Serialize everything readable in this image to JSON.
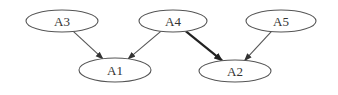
{
  "diagram": {
    "type": "directed-graph",
    "nodes": [
      {
        "id": "A3",
        "label": "A3",
        "cx": 62,
        "cy": 21,
        "rx": 36,
        "ry": 11
      },
      {
        "id": "A4",
        "label": "A4",
        "cx": 173,
        "cy": 21,
        "rx": 34,
        "ry": 11
      },
      {
        "id": "A5",
        "label": "A5",
        "cx": 281,
        "cy": 21,
        "rx": 35,
        "ry": 11
      },
      {
        "id": "A1",
        "label": "A1",
        "cx": 115,
        "cy": 70,
        "rx": 36,
        "ry": 12
      },
      {
        "id": "A2",
        "label": "A2",
        "cx": 235,
        "cy": 71,
        "rx": 36,
        "ry": 11
      }
    ],
    "edges": [
      {
        "from": "A3",
        "to": "A1",
        "weight": "normal"
      },
      {
        "from": "A4",
        "to": "A1",
        "weight": "normal"
      },
      {
        "from": "A4",
        "to": "A2",
        "weight": "thick"
      },
      {
        "from": "A5",
        "to": "A2",
        "weight": "normal"
      }
    ],
    "colors": {
      "stroke": "#555555",
      "thick_stroke": "#222222",
      "text": "#333333",
      "background": "#ffffff"
    }
  }
}
